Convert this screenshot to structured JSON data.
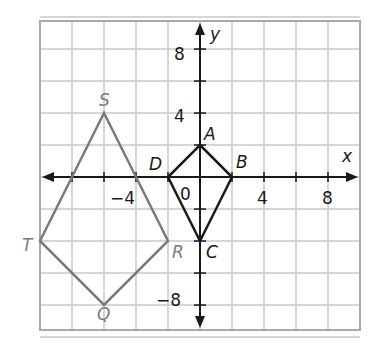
{
  "figure": {
    "type": "coordinate-plane",
    "axes": {
      "x_label": "x",
      "y_label": "y",
      "x_ticks": [
        "−4",
        "4",
        "8"
      ],
      "y_ticks": [
        "8",
        "4",
        "−8"
      ],
      "origin_label": "0",
      "range": {
        "xmin": -10,
        "xmax": 10,
        "ymin": -10,
        "ymax": 10
      },
      "grid_step": 2
    },
    "shapes": [
      {
        "name": "ABCD",
        "color": "#1a1a1a",
        "vertices": [
          {
            "label": "A",
            "x": 0,
            "y": 2
          },
          {
            "label": "B",
            "x": 2,
            "y": 0
          },
          {
            "label": "C",
            "x": 0,
            "y": -4
          },
          {
            "label": "D",
            "x": -2,
            "y": 0
          }
        ]
      },
      {
        "name": "QRST",
        "color": "#7a7a7a",
        "vertices": [
          {
            "label": "S",
            "x": -6,
            "y": 4
          },
          {
            "label": "R",
            "x": -2,
            "y": -4
          },
          {
            "label": "Q",
            "x": -6,
            "y": -8
          },
          {
            "label": "T",
            "x": -10,
            "y": -4
          }
        ]
      }
    ],
    "colors": {
      "grid": "#c8c8c8",
      "border": "#a8a8a8",
      "axis": "#1a1a1a",
      "black_shape": "#1a1a1a",
      "gray_shape": "#7a7a7a"
    }
  }
}
